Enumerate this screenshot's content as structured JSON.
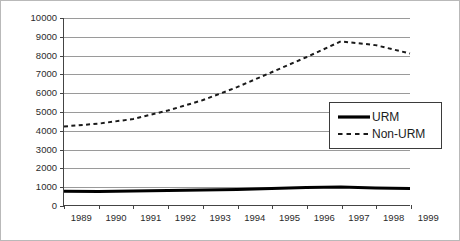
{
  "chart_data": {
    "type": "line",
    "title": "",
    "xlabel": "",
    "ylabel": "",
    "x": [
      1989,
      1990,
      1991,
      1992,
      1993,
      1994,
      1995,
      1996,
      1997,
      1998,
      1999
    ],
    "categories": [
      "1989",
      "1990",
      "1991",
      "1992",
      "1993",
      "1994",
      "1995",
      "1996",
      "1997",
      "1998",
      "1999"
    ],
    "ylim": [
      0,
      10000
    ],
    "xlim": [
      1989,
      1999
    ],
    "ytick_labels": [
      "0",
      "1000",
      "2000",
      "3000",
      "4000",
      "5000",
      "6000",
      "7000",
      "8000",
      "9000",
      "10000"
    ],
    "ytick_values": [
      0,
      1000,
      2000,
      3000,
      4000,
      5000,
      6000,
      7000,
      8000,
      9000,
      10000
    ],
    "grid": true,
    "legend_position": "upper-right",
    "series": [
      {
        "name": "URM",
        "style": "solid",
        "color": "#000000",
        "width": 3,
        "values": [
          740,
          720,
          745,
          775,
          800,
          830,
          880,
          930,
          960,
          905,
          880
        ]
      },
      {
        "name": "Non-URM",
        "style": "dashed",
        "color": "#1a1a1a",
        "width": 2,
        "values": [
          4200,
          4350,
          4600,
          5050,
          5600,
          6300,
          7100,
          7900,
          8750,
          8550,
          8100
        ]
      }
    ]
  },
  "legend": {
    "items": [
      {
        "label": "URM",
        "key": "solid-line-key"
      },
      {
        "label": "Non-URM",
        "key": "dashed-line-key"
      }
    ]
  }
}
